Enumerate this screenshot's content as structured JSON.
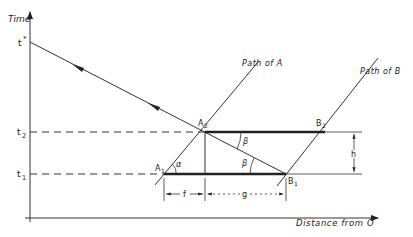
{
  "diagram": {
    "axes": {
      "y_label": "Time",
      "x_label": "Distance from O"
    },
    "time_marks": {
      "t_star": "t",
      "t_star_sup": "*",
      "t2": "t",
      "t2_sub": "2",
      "t1": "t",
      "t1_sub": "1"
    },
    "paths": {
      "path_a": "Path of A",
      "path_b": "Path of B"
    },
    "points": {
      "A1": "A",
      "A1_sub": "1",
      "A2": "A",
      "A2_sub": "2",
      "B1": "B",
      "B1_sub": "1",
      "B2": "B",
      "B2_sub": "2"
    },
    "angles": {
      "alpha": "α",
      "beta_upper": "β",
      "beta_lower": "β"
    },
    "dimensions": {
      "f": "f",
      "g": "g",
      "h": "h"
    },
    "colors": {
      "line": "#333333",
      "thick": "#222222"
    }
  }
}
